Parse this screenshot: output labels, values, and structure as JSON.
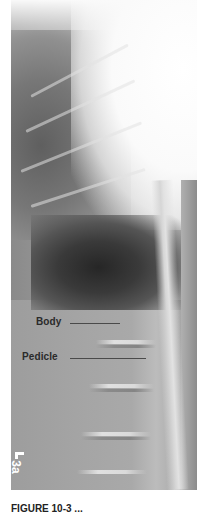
{
  "figure": {
    "type": "lateral thoracolumbar spine radiograph",
    "labels": [
      {
        "text": "Body"
      },
      {
        "text": "Pedicle"
      }
    ],
    "marker": {
      "text": "3a"
    },
    "caption": {
      "text": "FIGURE 10-3 ..."
    }
  }
}
